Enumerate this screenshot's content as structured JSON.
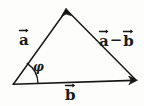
{
  "figure": {
    "kind": "vector-triangle-diagram",
    "background_color": "#fdfdfc",
    "ink_color": "#161616",
    "width": 144,
    "height": 106
  },
  "labels": {
    "vector_a": "a",
    "vector_a_minus_b_first": "a",
    "vector_a_minus_b_operator": "−",
    "vector_a_minus_b_second": "b",
    "vector_b": "b",
    "angle_phi": "φ"
  },
  "geometry": {
    "origin": {
      "x": 13,
      "y": 84
    },
    "apex": {
      "x": 66,
      "y": 9
    },
    "right_vertex": {
      "x": 136,
      "y": 80
    },
    "angle_arc_radius": 25
  }
}
